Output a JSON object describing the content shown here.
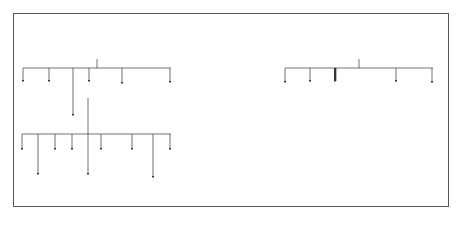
{
  "diagram": {
    "title_lines": [
      "Plant Molecular Farming",
      "Products"
    ],
    "center_image": "plant-illustration",
    "left": {
      "heading": "By-products",
      "row1": [
        "Vitamins",
        "Bioplastics",
        "Secondary Metabolites",
        "Nutraceutics",
        "Cofactors"
      ],
      "row1_lines": {
        "secondary": [
          "Secondary",
          "Metabolites"
        ]
      },
      "fibers": "Fibers",
      "row2": [
        "Tannins",
        "Sugars",
        "Starch",
        "Alkaloids",
        "Perfumes",
        "Scents"
      ],
      "row3": [
        "Phenolic Compounds",
        "Glucosinolates",
        "Aromas"
      ],
      "row3_lines": {
        "phenolic": [
          "Phenolic",
          "Compounds"
        ]
      }
    },
    "right": {
      "heading": "Primary Products",
      "row1": [
        "Vaccines",
        "Antibodies",
        "Drugs",
        "Enzymes",
        "Therapeutic Agents"
      ],
      "row1_lines": {
        "therapeutic": [
          "Therapeutic",
          "Agents"
        ]
      },
      "row2": [
        "Antibody Fragments",
        "Structural Proteins",
        "Enzyme Inhibitors"
      ],
      "row2_lines": {
        "antibody": [
          "Antibody",
          "Fragments"
        ],
        "structural": [
          "Structural",
          "Proteins"
        ],
        "inhibitors": [
          "Enzyme",
          "Inhibitors"
        ]
      },
      "row3": [
        "Therapeutic",
        "Industrial",
        "Cosmetic",
        "Diagnostic"
      ]
    },
    "colors": {
      "heading_fill": "#b3b3b3",
      "line": "#333333",
      "leaf_green": "#7fb069"
    }
  }
}
